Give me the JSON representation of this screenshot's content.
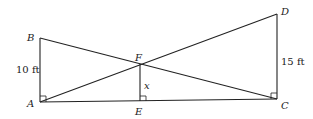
{
  "diagram": {
    "points": {
      "A": {
        "label": "A",
        "x": 40,
        "y": 102
      },
      "B": {
        "label": "B",
        "x": 40,
        "y": 38
      },
      "C": {
        "label": "C",
        "x": 277,
        "y": 99
      },
      "D": {
        "label": "D",
        "x": 277,
        "y": 14
      },
      "E": {
        "label": "E",
        "x": 140,
        "y": 101
      },
      "F": {
        "label": "F",
        "x": 140,
        "y": 64
      }
    },
    "segments": [
      "AB",
      "AC",
      "CD",
      "BC",
      "AD",
      "EF"
    ],
    "measurements": {
      "AB": "10 ft",
      "CD": "15 ft",
      "EF": "x"
    },
    "right_angles": [
      "A",
      "E",
      "C"
    ]
  }
}
